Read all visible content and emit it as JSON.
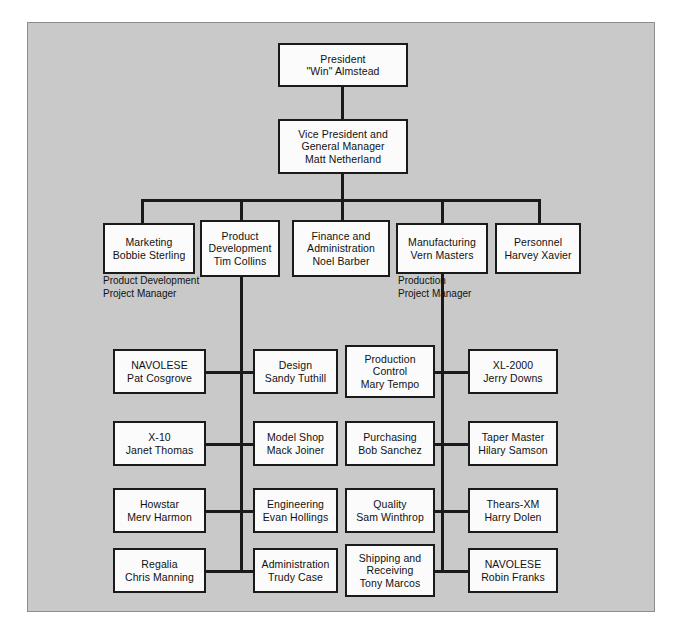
{
  "diagram": {
    "background_color": "#c9c9c9",
    "box_fill_color": "#fbfbfb",
    "line_color": "#1a1a1a",
    "frame_border_color": "#8d8d8d"
  },
  "nodes": {
    "president": {
      "line1": "President",
      "line2": "\"Win\" Almstead"
    },
    "vice_president": {
      "line1": "Vice President and",
      "line2": "General Manager",
      "line3": "Matt Netherland"
    },
    "marketing": {
      "line1": "Marketing",
      "line2": "Bobbie Sterling"
    },
    "product_development": {
      "line1": "Product",
      "line2": "Development",
      "line3": "Tim Collins"
    },
    "finance": {
      "line1": "Finance and",
      "line2": "Administration",
      "line3": "Noel Barber"
    },
    "manufacturing": {
      "line1": "Manufacturing",
      "line2": "Vern Masters"
    },
    "personnel": {
      "line1": "Personnel",
      "line2": "Harvey Xavier"
    },
    "navolese_pat": {
      "line1": "NAVOLESE",
      "line2": "Pat Cosgrove"
    },
    "design": {
      "line1": "Design",
      "line2": "Sandy Tuthill"
    },
    "x10": {
      "line1": "X-10",
      "line2": "Janet Thomas"
    },
    "model_shop": {
      "line1": "Model Shop",
      "line2": "Mack Joiner"
    },
    "howstar": {
      "line1": "Howstar",
      "line2": "Merv Harmon"
    },
    "engineering": {
      "line1": "Engineering",
      "line2": "Evan Hollings"
    },
    "regalia": {
      "line1": "Regalia",
      "line2": "Chris Manning"
    },
    "administration": {
      "line1": "Administration",
      "line2": "Trudy Case"
    },
    "production_control": {
      "line1": "Production",
      "line2": "Control",
      "line3": "Mary Tempo"
    },
    "xl2000": {
      "line1": "XL-2000",
      "line2": "Jerry Downs"
    },
    "purchasing": {
      "line1": "Purchasing",
      "line2": "Bob Sanchez"
    },
    "taper_master": {
      "line1": "Taper Master",
      "line2": "Hilary Samson"
    },
    "quality": {
      "line1": "Quality",
      "line2": "Sam Winthrop"
    },
    "thears_xm": {
      "line1": "Thears-XM",
      "line2": "Harry Dolen"
    },
    "shipping": {
      "line1": "Shipping and",
      "line2": "Receiving",
      "line3": "Tony Marcos"
    },
    "navolese_robin": {
      "line1": "NAVOLESE",
      "line2": "Robin Franks"
    }
  },
  "labels": {
    "product_development_pm": {
      "line1": "Product Development",
      "line2": "Project Manager"
    },
    "production_pm": {
      "line1": "Production",
      "line2": "Project Manager"
    }
  }
}
